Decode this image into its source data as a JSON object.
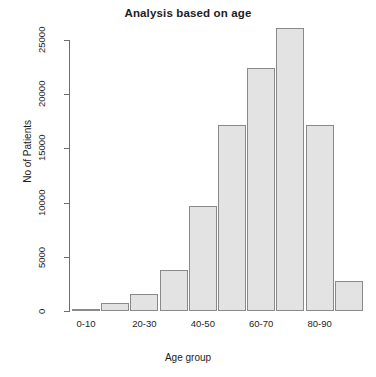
{
  "chart_data": {
    "type": "bar",
    "title": "Analysis based on age",
    "xlabel": "Age group",
    "ylabel": "No of Patients",
    "categories": [
      "0-10",
      "10-20",
      "20-30",
      "30-40",
      "40-50",
      "50-60",
      "60-70",
      "70-80",
      "80-90",
      "90-100"
    ],
    "values": [
      150,
      700,
      1600,
      3800,
      9700,
      17200,
      22400,
      26100,
      17200,
      2800
    ],
    "ylim": [
      0,
      26100
    ],
    "yticks": [
      0,
      5000,
      10000,
      15000,
      20000,
      25000
    ],
    "ytick_labels": [
      "0",
      "5000",
      "10000",
      "15000",
      "20000",
      "25000"
    ],
    "xtick_labels_visible": [
      "0-10",
      "20-30",
      "40-50",
      "60-70",
      "80-90"
    ],
    "xtick_label_indices": [
      0,
      2,
      4,
      6,
      8
    ],
    "grid": false,
    "legend": null,
    "bar_fill_color": "#e3e3e3",
    "bar_border_color": "#8a8a8a",
    "axis_color": "#6e6e6e",
    "text_color": "#1d1d1d",
    "background_color": "#ffffff"
  }
}
